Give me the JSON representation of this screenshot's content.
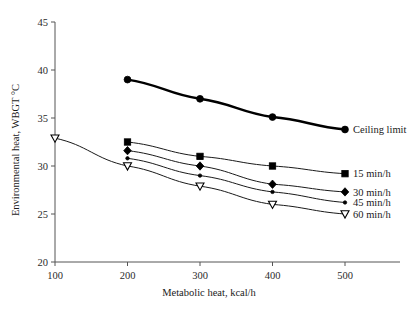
{
  "chart_data": {
    "type": "line",
    "title": "",
    "xlabel": "Metabolic heat, kcal/h",
    "ylabel": "Environmental heat, WBGT °C",
    "xlim": [
      100,
      520
    ],
    "ylim": [
      20,
      45
    ],
    "xticks": [
      100,
      200,
      300,
      400,
      500
    ],
    "xtick_labels": [
      "100",
      "200",
      "300",
      "400",
      "500"
    ],
    "yticks": [
      20,
      25,
      30,
      35,
      40,
      45
    ],
    "ytick_labels": [
      "20",
      "25",
      "30",
      "35",
      "40",
      "45"
    ],
    "grid": false,
    "legend_position": "right-inline-labels",
    "series": [
      {
        "name": "Ceiling limit",
        "label": "Ceiling limit",
        "marker": "circle",
        "line_weight": "thick",
        "x": [
          200,
          300,
          400,
          500
        ],
        "values": [
          39.0,
          37.0,
          35.1,
          33.8
        ]
      },
      {
        "name": "15 min/h",
        "label": "15 min/h",
        "marker": "square",
        "line_weight": "thin",
        "x": [
          200,
          300,
          400,
          500
        ],
        "values": [
          32.5,
          31.0,
          30.0,
          29.2
        ]
      },
      {
        "name": "30 min/h",
        "label": "30 min/h",
        "marker": "diamond",
        "line_weight": "thin",
        "x": [
          200,
          300,
          400,
          500
        ],
        "values": [
          31.6,
          30.0,
          28.1,
          27.3
        ]
      },
      {
        "name": "45 min/h",
        "label": "45 min/h",
        "marker": "dot",
        "line_weight": "thin",
        "x": [
          200,
          300,
          400,
          500
        ],
        "values": [
          30.8,
          29.0,
          27.3,
          26.2
        ]
      },
      {
        "name": "60 min/h",
        "label": "60 min/h",
        "marker": "triangle-down-open",
        "line_weight": "thin",
        "x": [
          100,
          200,
          300,
          400,
          500
        ],
        "values": [
          32.9,
          30.0,
          27.9,
          26.0,
          25.0
        ]
      }
    ]
  },
  "colors": {
    "axis": "#555555",
    "series": "#000000",
    "background": "#ffffff"
  }
}
